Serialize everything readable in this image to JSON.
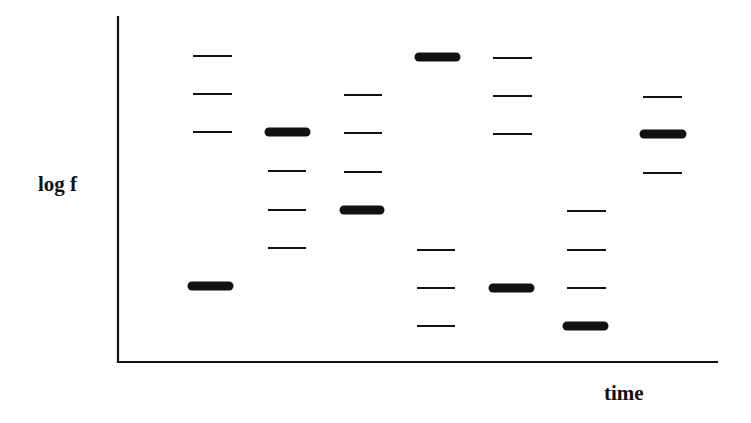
{
  "diagram": {
    "type": "spectrogram-schematic",
    "x_axis_label": "time",
    "y_axis_label": "log f",
    "colors": {
      "ink": "#111111",
      "background": "#ffffff"
    },
    "axes": {
      "origin": [
        118,
        362
      ],
      "y_top": 17,
      "x_right": 717
    },
    "columns": [
      {
        "index": 1,
        "bands": [
          {
            "y": 56,
            "x1": 193,
            "x2": 232,
            "strength": "weak"
          },
          {
            "y": 94,
            "x1": 193,
            "x2": 232,
            "strength": "weak"
          },
          {
            "y": 132,
            "x1": 193,
            "x2": 232,
            "strength": "weak"
          },
          {
            "y": 286,
            "x1": 188,
            "x2": 233,
            "strength": "strong"
          }
        ]
      },
      {
        "index": 2,
        "bands": [
          {
            "y": 132,
            "x1": 265,
            "x2": 310,
            "strength": "strong"
          },
          {
            "y": 171,
            "x1": 268,
            "x2": 306,
            "strength": "weak"
          },
          {
            "y": 210,
            "x1": 268,
            "x2": 306,
            "strength": "weak"
          },
          {
            "y": 248,
            "x1": 268,
            "x2": 306,
            "strength": "weak"
          }
        ]
      },
      {
        "index": 3,
        "bands": [
          {
            "y": 95,
            "x1": 344,
            "x2": 382,
            "strength": "weak"
          },
          {
            "y": 133,
            "x1": 344,
            "x2": 382,
            "strength": "weak"
          },
          {
            "y": 172,
            "x1": 344,
            "x2": 382,
            "strength": "weak"
          },
          {
            "y": 210,
            "x1": 340,
            "x2": 384,
            "strength": "strong"
          }
        ]
      },
      {
        "index": 4,
        "bands": [
          {
            "y": 57,
            "x1": 415,
            "x2": 460,
            "strength": "strong"
          },
          {
            "y": 250,
            "x1": 417,
            "x2": 455,
            "strength": "weak"
          },
          {
            "y": 288,
            "x1": 417,
            "x2": 455,
            "strength": "weak"
          },
          {
            "y": 326,
            "x1": 417,
            "x2": 455,
            "strength": "weak"
          }
        ]
      },
      {
        "index": 5,
        "bands": [
          {
            "y": 58,
            "x1": 493,
            "x2": 532,
            "strength": "weak"
          },
          {
            "y": 96,
            "x1": 493,
            "x2": 532,
            "strength": "weak"
          },
          {
            "y": 134,
            "x1": 493,
            "x2": 532,
            "strength": "weak"
          },
          {
            "y": 288,
            "x1": 489,
            "x2": 534,
            "strength": "strong"
          }
        ]
      },
      {
        "index": 6,
        "bands": [
          {
            "y": 211,
            "x1": 567,
            "x2": 606,
            "strength": "weak"
          },
          {
            "y": 250,
            "x1": 567,
            "x2": 606,
            "strength": "weak"
          },
          {
            "y": 288,
            "x1": 567,
            "x2": 606,
            "strength": "weak"
          },
          {
            "y": 326,
            "x1": 563,
            "x2": 608,
            "strength": "strong"
          }
        ]
      },
      {
        "index": 7,
        "bands": [
          {
            "y": 97,
            "x1": 643,
            "x2": 682,
            "strength": "weak"
          },
          {
            "y": 134,
            "x1": 640,
            "x2": 686,
            "strength": "strong"
          },
          {
            "y": 173,
            "x1": 643,
            "x2": 682,
            "strength": "weak"
          }
        ]
      }
    ]
  }
}
